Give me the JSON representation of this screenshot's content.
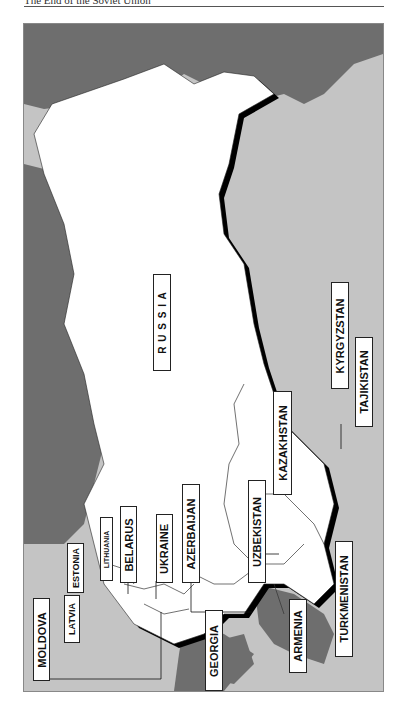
{
  "page": {
    "running_head": "The End of the Soviet Union"
  },
  "colors": {
    "land_ussr": "#ffffff",
    "land_other": "#c4c4c4",
    "sea": "#6e6e6e",
    "shadow": "#000000"
  },
  "map": {
    "title": "Former Soviet Republics",
    "labels": {
      "russia": "R U S S I A",
      "moldova": "MOLDOVA",
      "latvia": "LATVIA",
      "estonia": "ESTONIA",
      "lithuania": "LITHUANIA",
      "belarus": "BELARUS",
      "ukraine": "UKRAINE",
      "azerbaijan": "AZERBAIJAN",
      "uzbekistan": "UZBEKISTAN",
      "kazakhstan": "KAZAKHSTAN",
      "georgia": "GEORGIA",
      "armenia": "ARMENIA",
      "turkmenistan": "TURKMENISTAN",
      "kyrgyzstan": "KYRGYZSTAN",
      "tajikistan": "TAJIKISTAN"
    }
  }
}
